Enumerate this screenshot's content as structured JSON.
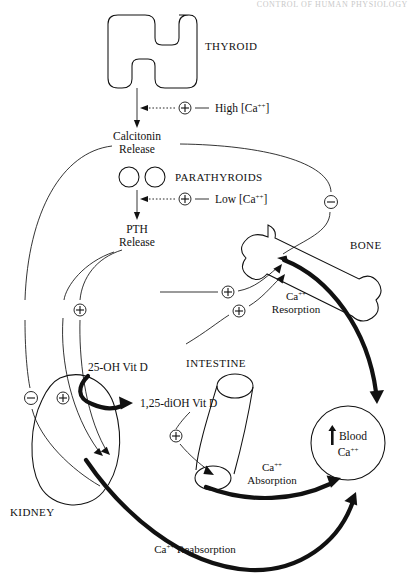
{
  "page": {
    "header_text": "CONTROL OF HUMAN PHYSIOLOGY"
  },
  "organs": {
    "thyroid": {
      "label": "THYROID",
      "shape": "butterfly-h"
    },
    "parathyroids": {
      "label": "PARATHYROIDS",
      "shape": "two-circles"
    },
    "bone": {
      "label": "BONE",
      "shape": "long-bone"
    },
    "intestine": {
      "label": "INTESTINE",
      "shape": "tube"
    },
    "kidney": {
      "label": "KIDNEY",
      "shape": "bean"
    },
    "blood": {
      "label_line1": "Blood",
      "label_line2": "Ca",
      "sup": "++",
      "arrow": "↑",
      "shape": "circle"
    }
  },
  "hormones": {
    "calcitonin": {
      "line1": "Calcitonin",
      "line2": "Release"
    },
    "pth": {
      "line1": "PTH",
      "line2": "Release"
    },
    "vit_d_precursor": "25-OH Vit D",
    "vit_d_active": "1,25-diOH Vit D"
  },
  "stimuli": {
    "high_ca": {
      "text": "High [Ca",
      "sup": "++",
      "close": "]",
      "sign": "+"
    },
    "low_ca": {
      "text": "Low [Ca",
      "sup": "++",
      "close": "]",
      "sign": "+"
    }
  },
  "processes": {
    "resorption": {
      "line1": "Ca",
      "sup": "++",
      "line2": "Resorption"
    },
    "absorption": {
      "line1": "Ca",
      "sup": "++",
      "line2": "Absorption"
    },
    "reabsorption": {
      "line1": "Ca",
      "sup": "++",
      "line2": " Reabsorption"
    }
  },
  "signs": {
    "plus": "+",
    "minus": "−",
    "nodes": [
      {
        "name": "high-ca-plus",
        "sign": "+",
        "x": 185,
        "y": 108
      },
      {
        "name": "low-ca-plus",
        "sign": "+",
        "x": 185,
        "y": 199
      },
      {
        "name": "calcitonin-bone-minus",
        "sign": "−",
        "x": 330,
        "y": 202
      },
      {
        "name": "pth-bone-plus-upper",
        "sign": "+",
        "x": 228,
        "y": 292
      },
      {
        "name": "pth-bone-plus-lower",
        "sign": "+",
        "x": 239,
        "y": 311
      },
      {
        "name": "pth-kidney-plus",
        "sign": "+",
        "x": 79,
        "y": 310
      },
      {
        "name": "calcitonin-kidney-minus",
        "sign": "−",
        "x": 30,
        "y": 398
      },
      {
        "name": "pth-kidney-plus-low",
        "sign": "+",
        "x": 63,
        "y": 398
      },
      {
        "name": "vitd-intestine-plus",
        "sign": "+",
        "x": 176,
        "y": 436
      }
    ]
  },
  "colors": {
    "ink": "#111111",
    "paper": "#ffffff",
    "header": "#c9c9c9"
  }
}
